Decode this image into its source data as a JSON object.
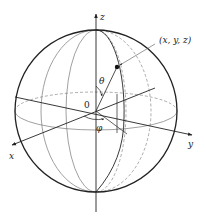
{
  "diagram": {
    "labels": {
      "z_axis": "z",
      "y_axis": "y",
      "x_axis": "x",
      "origin": "0",
      "theta": "θ",
      "phi": "φ",
      "point": "(x, y, z)"
    },
    "colors": {
      "stroke": "#222222",
      "light_stroke": "#888888",
      "background": "#ffffff"
    },
    "sphere": {
      "cx": 96,
      "cy": 111,
      "r": 81
    }
  }
}
